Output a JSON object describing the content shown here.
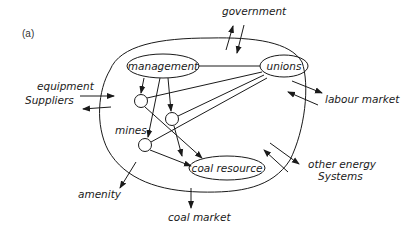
{
  "figure": {
    "panel_label": "(a)",
    "system_nodes": {
      "management": "management",
      "unions": "unions",
      "mines": "mines",
      "coal_resource": "coal resource"
    },
    "external_actors": {
      "government": "government",
      "equipment_suppliers_line1": "equipment",
      "equipment_suppliers_line2": "Suppliers",
      "labour_market": "labour market",
      "other_energy_line1": "other energy",
      "other_energy_line2": "Systems",
      "amenity": "amenity",
      "coal_market": "coal market"
    },
    "colors": {
      "ink": "#1a1a1a",
      "background": "#ffffff"
    }
  }
}
